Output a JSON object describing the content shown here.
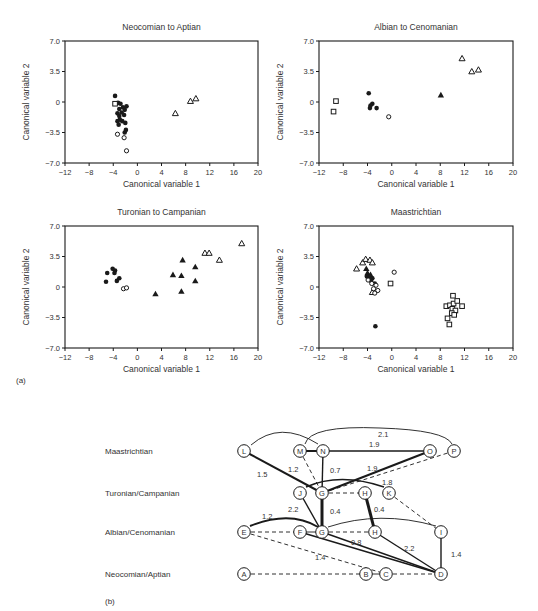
{
  "figure": {
    "part_a_label": "(a)",
    "part_b_label": "(b)"
  },
  "chart_data": [
    {
      "type": "scatter",
      "title": "Neocomian to Aptian",
      "xlabel": "Canonical variable 1",
      "ylabel": "Canonical variable 2",
      "xlim": [
        -12,
        20
      ],
      "ylim": [
        -7.0,
        7.0
      ],
      "xticks": [
        "-12",
        "-8",
        "-4",
        "0",
        "4",
        "8",
        "12",
        "16",
        "20"
      ],
      "yticks": [
        "7.0",
        "3.5",
        "0",
        "-3.5",
        "-7.0"
      ],
      "grid": false,
      "frame": {
        "x": 65,
        "y": 41,
        "w": 193,
        "h": 122
      },
      "series": [
        {
          "name": "filled-circle",
          "marker": "filled-circle",
          "points": [
            [
              -3.7,
              0.7
            ],
            [
              -3.2,
              -0.1
            ],
            [
              -2.8,
              -0.2
            ],
            [
              -3.0,
              -0.8
            ],
            [
              -2.4,
              -0.6
            ],
            [
              -1.8,
              -0.5
            ],
            [
              -2.1,
              -0.9
            ],
            [
              -2.6,
              -1.2
            ],
            [
              -3.3,
              -1.3
            ],
            [
              -3.0,
              -1.6
            ],
            [
              -2.2,
              -1.5
            ],
            [
              -2.9,
              -2.0
            ],
            [
              -3.3,
              -2.2
            ],
            [
              -2.5,
              -2.2
            ],
            [
              -3.1,
              -2.6
            ],
            [
              -2.0,
              -2.4
            ],
            [
              -1.9,
              -3.2
            ],
            [
              -2.1,
              -3.5
            ]
          ]
        },
        {
          "name": "open-circle",
          "marker": "open-circle",
          "points": [
            [
              -3.3,
              -3.7
            ],
            [
              -2.2,
              -4.1
            ],
            [
              -1.8,
              -5.6
            ]
          ]
        },
        {
          "name": "open-square",
          "marker": "open-square",
          "points": [
            [
              -3.7,
              -0.2
            ]
          ]
        },
        {
          "name": "open-triangle",
          "marker": "open-triangle",
          "points": [
            [
              6.3,
              -1.3
            ],
            [
              8.8,
              0.1
            ],
            [
              9.7,
              0.4
            ]
          ]
        }
      ]
    },
    {
      "type": "scatter",
      "title": "Albian to Cenomanian",
      "xlabel": "Canonical variable 1",
      "ylabel": "Canonical variable 2",
      "xlim": [
        -12,
        20
      ],
      "ylim": [
        -7.0,
        7.0
      ],
      "xticks": [
        "-12",
        "-8",
        "-4",
        "0",
        "4",
        "8",
        "12",
        "16",
        "20"
      ],
      "yticks": [
        "7.0",
        "3.5",
        "0",
        "-3.5",
        "-7.0"
      ],
      "grid": false,
      "frame": {
        "x": 319,
        "y": 41,
        "w": 194,
        "h": 122
      },
      "series": [
        {
          "name": "filled-circle",
          "marker": "filled-circle",
          "points": [
            [
              -3.8,
              1.0
            ],
            [
              -3.2,
              -0.2
            ],
            [
              -3.5,
              -0.4
            ],
            [
              -3.6,
              -0.7
            ],
            [
              -2.5,
              -0.7
            ]
          ]
        },
        {
          "name": "open-circle",
          "marker": "open-circle",
          "points": [
            [
              -0.5,
              -1.7
            ]
          ]
        },
        {
          "name": "open-square",
          "marker": "open-square",
          "points": [
            [
              -9.2,
              0.1
            ],
            [
              -9.6,
              -1.1
            ]
          ]
        },
        {
          "name": "filled-triangle",
          "marker": "filled-triangle",
          "points": [
            [
              8.1,
              0.8
            ]
          ]
        },
        {
          "name": "open-triangle",
          "marker": "open-triangle",
          "points": [
            [
              11.6,
              5.0
            ],
            [
              13.2,
              3.5
            ],
            [
              14.3,
              3.7
            ]
          ]
        }
      ]
    },
    {
      "type": "scatter",
      "title": "Turonian to Campanian",
      "xlabel": "Canonical variable 1",
      "ylabel": "Canonical variable 2",
      "xlim": [
        -12,
        20
      ],
      "ylim": [
        -7.0,
        7.0
      ],
      "xticks": [
        "-12",
        "-8",
        "-4",
        "0",
        "4",
        "8",
        "12",
        "16",
        "20"
      ],
      "yticks": [
        "7.0",
        "3.5",
        "0",
        "-3.5",
        "-7.0"
      ],
      "grid": false,
      "frame": {
        "x": 65,
        "y": 226,
        "w": 193,
        "h": 122
      },
      "series": [
        {
          "name": "filled-circle",
          "marker": "filled-circle",
          "points": [
            [
              -5.0,
              1.6
            ],
            [
              -5.2,
              0.6
            ],
            [
              -4.1,
              2.1
            ],
            [
              -3.7,
              1.9
            ],
            [
              -3.8,
              1.6
            ],
            [
              -3.4,
              0.7
            ],
            [
              -3.0,
              1.0
            ]
          ]
        },
        {
          "name": "open-circle",
          "marker": "open-circle",
          "points": [
            [
              -2.3,
              -0.2
            ],
            [
              -1.8,
              -0.1
            ]
          ]
        },
        {
          "name": "filled-triangle",
          "marker": "filled-triangle",
          "points": [
            [
              3.0,
              -0.8
            ],
            [
              5.9,
              1.4
            ],
            [
              7.3,
              1.3
            ],
            [
              7.5,
              3.1
            ],
            [
              7.3,
              -0.5
            ],
            [
              9.6,
              2.3
            ],
            [
              9.6,
              0.7
            ]
          ]
        },
        {
          "name": "open-triangle",
          "marker": "open-triangle",
          "points": [
            [
              11.2,
              3.9
            ],
            [
              11.9,
              3.9
            ],
            [
              13.6,
              3.1
            ],
            [
              17.3,
              5.0
            ]
          ]
        }
      ]
    },
    {
      "type": "scatter",
      "title": "Maastrichtian",
      "xlabel": "Canonical variable 1",
      "ylabel": "Canonical variable 2",
      "xlim": [
        -12,
        20
      ],
      "ylim": [
        -7.0,
        7.0
      ],
      "xticks": [
        "-12",
        "-8",
        "-4",
        "0",
        "4",
        "8",
        "12",
        "16",
        "20"
      ],
      "yticks": [
        "7.0",
        "3.5",
        "0",
        "-3.5",
        "-7.0"
      ],
      "grid": false,
      "frame": {
        "x": 319,
        "y": 226,
        "w": 194,
        "h": 122
      },
      "series": [
        {
          "name": "open-triangle",
          "marker": "open-triangle",
          "points": [
            [
              -5.8,
              2.1
            ],
            [
              -4.8,
              2.8
            ],
            [
              -4.3,
              3.2
            ],
            [
              -3.6,
              3.1
            ],
            [
              -3.2,
              2.8
            ],
            [
              -3.2,
              -0.6
            ]
          ]
        },
        {
          "name": "filled-triangle",
          "marker": "filled-triangle",
          "points": [
            [
              -4.2,
              2.1
            ],
            [
              -4.0,
              1.6
            ],
            [
              -3.8,
              1.3
            ],
            [
              -3.5,
              1.4
            ]
          ]
        },
        {
          "name": "filled-circle",
          "marker": "filled-circle",
          "points": [
            [
              -4.1,
              1.2
            ],
            [
              -3.6,
              1.2
            ],
            [
              -3.2,
              1.0
            ],
            [
              -3.4,
              0.7
            ],
            [
              -2.8,
              0.4
            ],
            [
              -2.7,
              -4.5
            ]
          ]
        },
        {
          "name": "open-circle",
          "marker": "open-circle",
          "points": [
            [
              -3.9,
              0.8
            ],
            [
              -3.3,
              0.4
            ],
            [
              -2.6,
              0.2
            ],
            [
              -3.0,
              -0.2
            ],
            [
              -2.3,
              -0.4
            ],
            [
              -2.8,
              -0.7
            ],
            [
              0.4,
              1.7
            ]
          ]
        },
        {
          "name": "open-square",
          "marker": "open-square",
          "points": [
            [
              -0.2,
              0.4
            ],
            [
              10.1,
              -1.0
            ],
            [
              9.0,
              -2.2
            ],
            [
              9.6,
              -2.1
            ],
            [
              10.2,
              -1.9
            ],
            [
              10.8,
              -1.6
            ],
            [
              11.6,
              -2.2
            ],
            [
              10.0,
              -2.5
            ],
            [
              10.5,
              -2.7
            ],
            [
              9.9,
              -3.0
            ],
            [
              10.3,
              -3.2
            ],
            [
              9.2,
              -3.6
            ],
            [
              9.5,
              -4.3
            ]
          ]
        }
      ]
    },
    {
      "type": "network",
      "rows": [
        {
          "label": "Maastrichtian",
          "y": 451
        },
        {
          "label": "Turonian/Campanian",
          "y": 493
        },
        {
          "label": "Albian/Cenomanian",
          "y": 532
        },
        {
          "label": "Neocomian/Aptian",
          "y": 574
        }
      ],
      "nodes": [
        {
          "id": "L",
          "label": "L",
          "x": 244,
          "y": 451
        },
        {
          "id": "M",
          "label": "M",
          "x": 300,
          "y": 451
        },
        {
          "id": "N",
          "label": "N",
          "x": 323,
          "y": 451
        },
        {
          "id": "O",
          "label": "O",
          "x": 430,
          "y": 451
        },
        {
          "id": "P",
          "label": "P",
          "x": 454,
          "y": 451
        },
        {
          "id": "J",
          "label": "J",
          "x": 300,
          "y": 493
        },
        {
          "id": "G1",
          "label": "G",
          "x": 322,
          "y": 493
        },
        {
          "id": "H1",
          "label": "H",
          "x": 365,
          "y": 493
        },
        {
          "id": "K",
          "label": "K",
          "x": 389,
          "y": 493
        },
        {
          "id": "E",
          "label": "E",
          "x": 244,
          "y": 532
        },
        {
          "id": "F",
          "label": "F",
          "x": 300,
          "y": 532
        },
        {
          "id": "G2",
          "label": "G",
          "x": 322,
          "y": 532
        },
        {
          "id": "H2",
          "label": "H",
          "x": 375,
          "y": 532
        },
        {
          "id": "I",
          "label": "I",
          "x": 441,
          "y": 532
        },
        {
          "id": "A",
          "label": "A",
          "x": 244,
          "y": 574
        },
        {
          "id": "B",
          "label": "B",
          "x": 366,
          "y": 574
        },
        {
          "id": "C",
          "label": "C",
          "x": 386,
          "y": 574
        },
        {
          "id": "D",
          "label": "D",
          "x": 441,
          "y": 574
        }
      ],
      "edges": [
        {
          "from": "L",
          "to": "G1",
          "style": "thick",
          "label": "1.5",
          "lx": 257,
          "ly": 477
        },
        {
          "from": "M",
          "to": "N",
          "style": "thick",
          "label": ""
        },
        {
          "from": "M",
          "to": "G1",
          "style": "dashed",
          "label": "1.2",
          "lx": 288,
          "ly": 472
        },
        {
          "from": "N",
          "to": "G1",
          "style": "medium",
          "label": "0.7",
          "lx": 330,
          "ly": 473
        },
        {
          "from": "N",
          "to": "O",
          "style": "medium",
          "label": "1.9",
          "lx": 369,
          "ly": 447
        },
        {
          "from": "O",
          "to": "G1",
          "style": "thick",
          "label": "1.9",
          "lx": 367,
          "ly": 471
        },
        {
          "from": "P",
          "to": "G1",
          "style": "dashed",
          "label": ""
        },
        {
          "from": "G1",
          "to": "H1",
          "style": "dashed",
          "label": ""
        },
        {
          "from": "J",
          "to": "G2",
          "style": "medium",
          "label": "2.2",
          "lx": 288,
          "ly": 512
        },
        {
          "from": "G1",
          "to": "G2",
          "style": "heavy",
          "label": "0.4",
          "lx": 330,
          "ly": 514
        },
        {
          "from": "H1",
          "to": "H2",
          "style": "heavy",
          "label": "0.4",
          "lx": 374,
          "ly": 512
        },
        {
          "from": "K",
          "to": "I",
          "style": "dashed",
          "label": ""
        },
        {
          "from": "E",
          "to": "F",
          "style": "dashed",
          "label": ""
        },
        {
          "from": "F",
          "to": "G2",
          "style": "thin",
          "label": ""
        },
        {
          "from": "G2",
          "to": "H2",
          "style": "dashed",
          "label": "0.8",
          "lx": 351,
          "ly": 545
        },
        {
          "from": "E",
          "to": "C",
          "style": "dashed",
          "label": "1.4",
          "lx": 315,
          "ly": 560
        },
        {
          "from": "F",
          "to": "D",
          "style": "medium",
          "label": ""
        },
        {
          "from": "G2",
          "to": "D",
          "style": "medium",
          "label": ""
        },
        {
          "from": "H2",
          "to": "D",
          "style": "medium",
          "label": "2.2",
          "lx": 404,
          "ly": 551
        },
        {
          "from": "I",
          "to": "D",
          "style": "medium",
          "label": "1.4",
          "lx": 451,
          "ly": 557
        },
        {
          "from": "A",
          "to": "B",
          "style": "dashed",
          "label": ""
        },
        {
          "from": "B",
          "to": "C",
          "style": "thin",
          "label": ""
        },
        {
          "from": "C",
          "to": "D",
          "style": "dashed",
          "label": ""
        }
      ],
      "arcs": [
        {
          "id": "arc-L-N",
          "d": "M 251 445 Q 280 420 318 444",
          "style": "thin",
          "label": ""
        },
        {
          "id": "arc-M-P",
          "d": "M 305 444 Q 310 425 380 428 Q 445 430 452 444",
          "style": "thin",
          "label": "2.1",
          "lx": 378,
          "ly": 437
        },
        {
          "id": "arc-J-K",
          "d": "M 306 487 Q 340 472 384 487",
          "style": "medium",
          "label": "1.8",
          "lx": 382,
          "ly": 485
        },
        {
          "id": "arc-E-G2",
          "d": "M 250 526 Q 290 510 318 527",
          "style": "thick",
          "label": "1.2",
          "lx": 262,
          "ly": 519
        },
        {
          "id": "arc-G2-I",
          "d": "M 328 527 Q 380 510 436 526",
          "style": "thin",
          "label": ""
        }
      ]
    }
  ]
}
